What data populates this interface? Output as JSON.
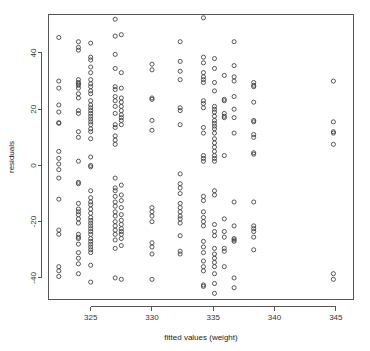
{
  "plot": {
    "title": "",
    "xlabel": "fitted values (weight)",
    "ylabel": "residuals",
    "point_color": "#3a3a3a",
    "axis_color": "#555555",
    "background": "#ffffff"
  },
  "chart_data": {
    "type": "scatter",
    "title": "",
    "xlabel": "fitted values (weight)",
    "ylabel": "residuals",
    "xlim": [
      321.6,
      346.4
    ],
    "ylim": [
      -47.5,
      53.5
    ],
    "xticks": [
      325,
      330,
      335,
      340,
      345
    ],
    "yticks": [
      -40,
      -20,
      0,
      20,
      40
    ],
    "xtick_labels": [
      "325",
      "330",
      "335",
      "340",
      "345"
    ],
    "ytick_labels": [
      "-40",
      "-20",
      "0",
      "20",
      "40"
    ],
    "grid": false,
    "legend": null,
    "marker": "open-circle",
    "points": [
      [
        322.4,
        45.5
      ],
      [
        322.4,
        30.0
      ],
      [
        322.4,
        27.5
      ],
      [
        322.4,
        21.5
      ],
      [
        322.4,
        19.0
      ],
      [
        322.4,
        15.2
      ],
      [
        322.4,
        15.0
      ],
      [
        322.4,
        5.0
      ],
      [
        322.4,
        2.5
      ],
      [
        322.4,
        0.5
      ],
      [
        322.4,
        -1.5
      ],
      [
        322.4,
        -4.5
      ],
      [
        322.4,
        -12.0
      ],
      [
        322.4,
        -23.0
      ],
      [
        322.4,
        -24.5
      ],
      [
        322.4,
        -36.0
      ],
      [
        322.4,
        -37.5
      ],
      [
        322.4,
        -39.5
      ],
      [
        324.0,
        44.0
      ],
      [
        324.0,
        42.0
      ],
      [
        324.0,
        41.0
      ],
      [
        324.0,
        30.5
      ],
      [
        324.0,
        29.5
      ],
      [
        324.0,
        29.0
      ],
      [
        324.0,
        28.5
      ],
      [
        324.0,
        27.5
      ],
      [
        324.0,
        25.5
      ],
      [
        324.0,
        24.0
      ],
      [
        324.0,
        19.5
      ],
      [
        324.0,
        18.5
      ],
      [
        324.0,
        12.0
      ],
      [
        324.0,
        10.0
      ],
      [
        324.0,
        1.5
      ],
      [
        324.0,
        -6.0
      ],
      [
        324.0,
        -6.5
      ],
      [
        324.0,
        -13.5
      ],
      [
        324.0,
        -15.5
      ],
      [
        324.0,
        -16.5
      ],
      [
        324.0,
        -17.5
      ],
      [
        324.0,
        -19.0
      ],
      [
        324.0,
        -20.5
      ],
      [
        324.0,
        -24.5
      ],
      [
        324.0,
        -25.5
      ],
      [
        324.0,
        -26.0
      ],
      [
        324.0,
        -28.0
      ],
      [
        324.0,
        -31.0
      ],
      [
        324.0,
        -33.0
      ],
      [
        324.0,
        -35.0
      ],
      [
        324.0,
        -38.5
      ],
      [
        325.0,
        43.5
      ],
      [
        325.0,
        38.5
      ],
      [
        325.0,
        37.5
      ],
      [
        325.0,
        35.0
      ],
      [
        325.0,
        33.0
      ],
      [
        325.0,
        30.5
      ],
      [
        325.0,
        29.0
      ],
      [
        325.0,
        28.0
      ],
      [
        325.0,
        26.5
      ],
      [
        325.0,
        25.5
      ],
      [
        325.0,
        23.0
      ],
      [
        325.0,
        21.5
      ],
      [
        325.0,
        20.5
      ],
      [
        325.0,
        19.5
      ],
      [
        325.0,
        18.5
      ],
      [
        325.0,
        17.5
      ],
      [
        325.0,
        16.5
      ],
      [
        325.0,
        15.5
      ],
      [
        325.0,
        14.5
      ],
      [
        325.0,
        13.0
      ],
      [
        325.0,
        12.0
      ],
      [
        325.0,
        9.5
      ],
      [
        325.0,
        3.0
      ],
      [
        325.0,
        0.0
      ],
      [
        325.0,
        -0.5
      ],
      [
        325.0,
        -9.0
      ],
      [
        325.0,
        -11.5
      ],
      [
        325.0,
        -13.0
      ],
      [
        325.0,
        -14.0
      ],
      [
        325.0,
        -15.5
      ],
      [
        325.0,
        -17.0
      ],
      [
        325.0,
        -18.5
      ],
      [
        325.0,
        -19.5
      ],
      [
        325.0,
        -20.5
      ],
      [
        325.0,
        -21.5
      ],
      [
        325.0,
        -22.5
      ],
      [
        325.0,
        -23.5
      ],
      [
        325.0,
        -24.5
      ],
      [
        325.0,
        -26.0
      ],
      [
        325.0,
        -27.0
      ],
      [
        325.0,
        -28.0
      ],
      [
        325.0,
        -29.0
      ],
      [
        325.0,
        -30.0
      ],
      [
        325.0,
        -31.0
      ],
      [
        325.0,
        -35.5
      ],
      [
        325.0,
        -41.5
      ],
      [
        327.0,
        52.0
      ],
      [
        327.0,
        46.0
      ],
      [
        327.0,
        39.5
      ],
      [
        327.0,
        34.5
      ],
      [
        327.0,
        28.0
      ],
      [
        327.0,
        27.0
      ],
      [
        327.0,
        24.5
      ],
      [
        327.0,
        23.0
      ],
      [
        327.0,
        21.0
      ],
      [
        327.0,
        18.5
      ],
      [
        327.0,
        14.5
      ],
      [
        327.0,
        13.5
      ],
      [
        327.0,
        10.5
      ],
      [
        327.0,
        9.0
      ],
      [
        327.0,
        7.5
      ],
      [
        327.0,
        -4.5
      ],
      [
        327.0,
        -8.0
      ],
      [
        327.0,
        -9.0
      ],
      [
        327.0,
        -11.0
      ],
      [
        327.0,
        -13.0
      ],
      [
        327.0,
        -14.5
      ],
      [
        327.0,
        -16.5
      ],
      [
        327.0,
        -18.0
      ],
      [
        327.0,
        -20.0
      ],
      [
        327.0,
        -21.5
      ],
      [
        327.0,
        -23.0
      ],
      [
        327.0,
        -24.5
      ],
      [
        327.0,
        -26.5
      ],
      [
        327.0,
        -29.5
      ],
      [
        327.0,
        -40.0
      ],
      [
        327.5,
        46.5
      ],
      [
        327.5,
        33.0
      ],
      [
        327.5,
        27.5
      ],
      [
        327.5,
        24.0
      ],
      [
        327.5,
        22.5
      ],
      [
        327.5,
        21.0
      ],
      [
        327.5,
        19.5
      ],
      [
        327.5,
        18.0
      ],
      [
        327.5,
        17.0
      ],
      [
        327.5,
        16.0
      ],
      [
        327.5,
        14.5
      ],
      [
        327.5,
        -7.0
      ],
      [
        327.5,
        -10.5
      ],
      [
        327.5,
        -12.5
      ],
      [
        327.5,
        -15.0
      ],
      [
        327.5,
        -17.5
      ],
      [
        327.5,
        -19.5
      ],
      [
        327.5,
        -21.0
      ],
      [
        327.5,
        -22.5
      ],
      [
        327.5,
        -23.5
      ],
      [
        327.5,
        -24.5
      ],
      [
        327.5,
        -26.0
      ],
      [
        327.5,
        -28.5
      ],
      [
        327.5,
        -40.5
      ],
      [
        330.0,
        36.0
      ],
      [
        330.0,
        34.0
      ],
      [
        330.0,
        24.0
      ],
      [
        330.0,
        23.5
      ],
      [
        330.0,
        16.0
      ],
      [
        330.0,
        12.5
      ],
      [
        330.0,
        -15.0
      ],
      [
        330.0,
        -16.5
      ],
      [
        330.0,
        -18.0
      ],
      [
        330.0,
        -20.0
      ],
      [
        330.0,
        -27.5
      ],
      [
        330.0,
        -29.0
      ],
      [
        330.0,
        -31.5
      ],
      [
        330.0,
        -40.5
      ],
      [
        332.3,
        44.0
      ],
      [
        332.3,
        37.0
      ],
      [
        332.3,
        33.5
      ],
      [
        332.3,
        30.5
      ],
      [
        332.3,
        20.5
      ],
      [
        332.3,
        19.5
      ],
      [
        332.3,
        14.5
      ],
      [
        332.3,
        -3.0
      ],
      [
        332.3,
        -6.5
      ],
      [
        332.3,
        -8.0
      ],
      [
        332.3,
        -10.0
      ],
      [
        332.3,
        -13.5
      ],
      [
        332.3,
        -15.0
      ],
      [
        332.3,
        -16.5
      ],
      [
        332.3,
        -18.0
      ],
      [
        332.3,
        -19.0
      ],
      [
        332.3,
        -20.5
      ],
      [
        332.3,
        -25.0
      ],
      [
        332.3,
        -30.5
      ],
      [
        332.3,
        -31.5
      ],
      [
        334.2,
        52.5
      ],
      [
        334.2,
        38.5
      ],
      [
        334.2,
        36.5
      ],
      [
        334.2,
        33.0
      ],
      [
        334.2,
        31.5
      ],
      [
        334.2,
        30.5
      ],
      [
        334.2,
        29.5
      ],
      [
        334.2,
        23.0
      ],
      [
        334.2,
        22.0
      ],
      [
        334.2,
        20.5
      ],
      [
        334.2,
        13.5
      ],
      [
        334.2,
        11.5
      ],
      [
        334.2,
        3.5
      ],
      [
        334.2,
        2.5
      ],
      [
        334.2,
        1.5
      ],
      [
        334.2,
        -11.0
      ],
      [
        334.2,
        -12.5
      ],
      [
        334.2,
        -16.5
      ],
      [
        334.2,
        -18.5
      ],
      [
        334.2,
        -20.0
      ],
      [
        334.2,
        -21.5
      ],
      [
        334.2,
        -27.0
      ],
      [
        334.2,
        -29.0
      ],
      [
        334.2,
        -31.0
      ],
      [
        334.2,
        -34.0
      ],
      [
        334.2,
        -36.0
      ],
      [
        334.2,
        -37.5
      ],
      [
        334.2,
        -42.5
      ],
      [
        334.2,
        -43.0
      ],
      [
        335.1,
        38.0
      ],
      [
        335.1,
        34.5
      ],
      [
        335.1,
        29.5
      ],
      [
        335.1,
        26.5
      ],
      [
        335.1,
        21.0
      ],
      [
        335.1,
        20.0
      ],
      [
        335.1,
        19.0
      ],
      [
        335.1,
        17.5
      ],
      [
        335.1,
        16.0
      ],
      [
        335.1,
        15.0
      ],
      [
        335.1,
        14.0
      ],
      [
        335.1,
        13.0
      ],
      [
        335.1,
        11.5
      ],
      [
        335.1,
        9.5
      ],
      [
        335.1,
        8.0
      ],
      [
        335.1,
        6.5
      ],
      [
        335.1,
        5.0
      ],
      [
        335.1,
        3.5
      ],
      [
        335.1,
        2.5
      ],
      [
        335.1,
        1.5
      ],
      [
        335.1,
        -9.0
      ],
      [
        335.1,
        -10.5
      ],
      [
        335.1,
        -21.0
      ],
      [
        335.1,
        -23.5
      ],
      [
        335.1,
        -25.0
      ],
      [
        335.1,
        -29.5
      ],
      [
        335.1,
        -31.5
      ],
      [
        335.1,
        -33.0
      ],
      [
        335.1,
        -34.5
      ],
      [
        335.1,
        -36.0
      ],
      [
        335.1,
        -38.5
      ],
      [
        335.1,
        -42.0
      ],
      [
        335.1,
        -45.5
      ],
      [
        335.9,
        32.0
      ],
      [
        335.9,
        23.5
      ],
      [
        335.9,
        23.0
      ],
      [
        335.9,
        18.5
      ],
      [
        335.9,
        17.5
      ],
      [
        335.9,
        17.0
      ],
      [
        335.9,
        3.5
      ],
      [
        335.9,
        -19.0
      ],
      [
        335.9,
        -23.5
      ],
      [
        335.9,
        -25.5
      ],
      [
        335.9,
        -29.5
      ],
      [
        335.9,
        -30.5
      ],
      [
        335.9,
        -36.0
      ],
      [
        336.7,
        44.0
      ],
      [
        336.7,
        35.5
      ],
      [
        336.7,
        31.5
      ],
      [
        336.7,
        30.0
      ],
      [
        336.7,
        24.5
      ],
      [
        336.7,
        20.0
      ],
      [
        336.7,
        17.0
      ],
      [
        336.7,
        11.5
      ],
      [
        336.7,
        -13.0
      ],
      [
        336.7,
        -21.5
      ],
      [
        336.7,
        -26.0
      ],
      [
        336.7,
        -26.5
      ],
      [
        336.7,
        -27.0
      ],
      [
        336.7,
        -40.0
      ],
      [
        336.7,
        -43.5
      ],
      [
        338.3,
        29.5
      ],
      [
        338.3,
        28.5
      ],
      [
        338.3,
        28.0
      ],
      [
        338.3,
        22.5
      ],
      [
        338.3,
        16.0
      ],
      [
        338.3,
        15.5
      ],
      [
        338.3,
        11.0
      ],
      [
        338.3,
        10.0
      ],
      [
        338.3,
        4.5
      ],
      [
        338.3,
        4.0
      ],
      [
        338.3,
        -13.0
      ],
      [
        338.3,
        -21.5
      ],
      [
        338.3,
        -22.5
      ],
      [
        338.3,
        -23.5
      ],
      [
        338.3,
        -25.5
      ],
      [
        338.3,
        -30.0
      ],
      [
        344.8,
        30.0
      ],
      [
        344.8,
        15.5
      ],
      [
        344.8,
        12.0
      ],
      [
        344.8,
        11.5
      ],
      [
        344.8,
        7.5
      ],
      [
        344.8,
        -38.5
      ],
      [
        344.8,
        -40.5
      ]
    ]
  }
}
